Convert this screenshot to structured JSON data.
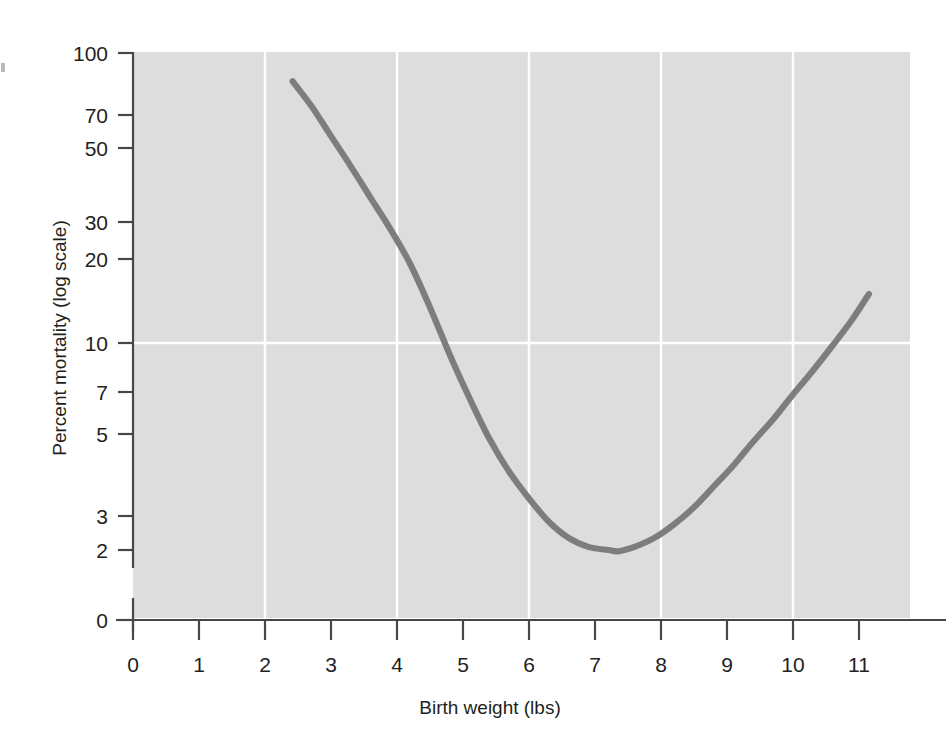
{
  "chart_data": {
    "type": "line",
    "title": "",
    "subtitle": "",
    "xlabel": "Birth weight (lbs)",
    "ylabel": "Percent mortality (log scale)",
    "xlim": [
      0,
      11.8
    ],
    "ylim_log": [
      1.7,
      110
    ],
    "yscale": "log",
    "xscale": "linear",
    "grid": "white gridlines on gray panel; vertical at even x values, horizontal at y = 10",
    "legend": "none",
    "xticks": [
      0,
      1,
      2,
      3,
      4,
      5,
      6,
      7,
      8,
      9,
      10,
      11
    ],
    "xticklabels": [
      "0",
      "1",
      "2",
      "3",
      "4",
      "5",
      "6",
      "7",
      "8",
      "9",
      "10",
      "11"
    ],
    "yticks": [
      0,
      2,
      3,
      5,
      7,
      10,
      20,
      30,
      50,
      70,
      100
    ],
    "yticklabels": [
      "0",
      "2",
      "3",
      "5",
      "7",
      "10",
      "20",
      "30",
      "50",
      "70",
      "100"
    ],
    "axis_break": "y axis broken between 2 and 0 (log scale cannot reach zero)",
    "series": [
      {
        "name": "Percent mortality vs birth weight",
        "color": "#7d7d7d",
        "linewidth": 6,
        "x": [
          2.42,
          2.7,
          3.0,
          3.3,
          3.6,
          3.9,
          4.2,
          4.5,
          4.8,
          5.1,
          5.4,
          5.7,
          6.0,
          6.3,
          6.6,
          6.9,
          7.2,
          7.35,
          7.6,
          7.9,
          8.2,
          8.5,
          8.8,
          9.1,
          9.4,
          9.7,
          10.0,
          10.3,
          10.6,
          10.9,
          11.15
        ],
        "y": [
          80.0,
          66.0,
          52.0,
          41.0,
          32.0,
          25.0,
          19.0,
          13.5,
          9.3,
          6.6,
          4.8,
          3.7,
          3.0,
          2.5,
          2.2,
          2.05,
          2.0,
          1.98,
          2.05,
          2.2,
          2.45,
          2.8,
          3.3,
          3.9,
          4.7,
          5.6,
          6.8,
          8.2,
          10.0,
          12.3,
          15.0
        ]
      }
    ],
    "annotations": []
  },
  "axes": {
    "x_axis_label": "Birth weight (lbs)",
    "y_axis_label": "Percent mortality (log scale)",
    "x_tick_labels": [
      "0",
      "1",
      "2",
      "3",
      "4",
      "5",
      "6",
      "7",
      "8",
      "9",
      "10",
      "11"
    ],
    "y_tick_labels": [
      "100",
      "70",
      "50",
      "30",
      "20",
      "10",
      "7",
      "5",
      "3",
      "2",
      "0"
    ]
  },
  "colors": {
    "panel": "#dcdcdc",
    "grid": "#ffffff",
    "curve": "#7d7d7d",
    "axis": "#4a4646",
    "text": "#231f20",
    "page": "#ffffff"
  }
}
